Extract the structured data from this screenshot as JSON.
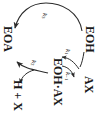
{
  "diagram": {
    "orientation": "rotated-90-clockwise",
    "species": {
      "eoh": "EOH",
      "eoa": "EOA",
      "complex": "EOH·AX",
      "substrate": "AX",
      "products": "H + X"
    },
    "rates": {
      "k1": "k",
      "k1_sub": "1",
      "kminus1": "k",
      "kminus1_sub": "−1",
      "k2": "k",
      "k2_sub": "2",
      "k3": "k",
      "k3_sub": "3"
    },
    "colors": {
      "stroke": "#2b2b2b",
      "text": "#1a1a1a",
      "background": "#ffffff"
    }
  }
}
